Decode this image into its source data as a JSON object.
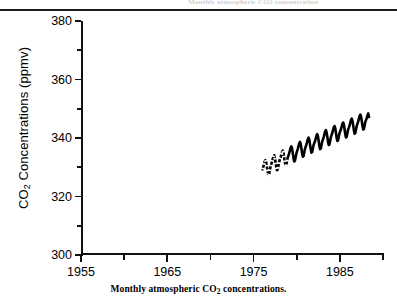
{
  "figure": {
    "top_ghost_text": "Monthly atmospheric CO2 concentrations",
    "caption_prefix": "Monthly atmospheric CO",
    "caption_sub": "2",
    "caption_suffix": " concentrations.",
    "ylabel_prefix": "CO",
    "ylabel_sub": "2",
    "ylabel_suffix": " Concentrations (ppmv)",
    "line_color": "#000000",
    "axis_color": "#111111",
    "background": "#ffffff"
  },
  "chart_data": {
    "type": "line",
    "title": "",
    "subtitle": "",
    "xlabel": "",
    "ylabel": "CO2 Concentrations (ppmv)",
    "caption": "Monthly atmospheric CO2 concentrations.",
    "grid": false,
    "legend": null,
    "xlim": [
      1955,
      1990
    ],
    "ylim": [
      300,
      380
    ],
    "xticks_major": [
      1955,
      1965,
      1975,
      1985
    ],
    "xticks_minor": [
      1960,
      1970,
      1980,
      1990
    ],
    "yticks_major": [
      300,
      320,
      340,
      360,
      380
    ],
    "yticks_minor": [
      310,
      330,
      350,
      370
    ],
    "xtick_labels": [
      "1955",
      "1965",
      "1975",
      "1985"
    ],
    "ytick_labels": [
      "300",
      "320",
      "340",
      "360",
      "380"
    ],
    "series": [
      {
        "name": "Monthly atmospheric CO2",
        "note": "Keeling-type record; monthly values with seasonal sawtooth. Early part of the drawn trace is broken/dashed.",
        "x": [
          1976.04,
          1976.13,
          1976.21,
          1976.29,
          1976.38,
          1976.46,
          1976.54,
          1976.63,
          1976.71,
          1976.79,
          1976.88,
          1976.96,
          1977.04,
          1977.13,
          1977.21,
          1977.29,
          1977.38,
          1977.46,
          1977.54,
          1977.63,
          1977.71,
          1977.79,
          1977.88,
          1977.96,
          1978.04,
          1978.13,
          1978.21,
          1978.29,
          1978.38,
          1978.46,
          1978.54,
          1978.63,
          1978.71,
          1978.79,
          1978.88,
          1978.96,
          1979.04,
          1979.13,
          1979.21,
          1979.29,
          1979.38,
          1979.46,
          1979.54,
          1979.63,
          1979.71,
          1979.79,
          1979.88,
          1979.96,
          1980.04,
          1980.13,
          1980.21,
          1980.29,
          1980.38,
          1980.46,
          1980.54,
          1980.63,
          1980.71,
          1980.79,
          1980.88,
          1980.96,
          1981.04,
          1981.13,
          1981.21,
          1981.29,
          1981.38,
          1981.46,
          1981.54,
          1981.63,
          1981.71,
          1981.79,
          1981.88,
          1981.96,
          1982.04,
          1982.13,
          1982.21,
          1982.29,
          1982.38,
          1982.46,
          1982.54,
          1982.63,
          1982.71,
          1982.79,
          1982.88,
          1982.96,
          1983.04,
          1983.13,
          1983.21,
          1983.29,
          1983.38,
          1983.46,
          1983.54,
          1983.63,
          1983.71,
          1983.79,
          1983.88,
          1983.96,
          1984.04,
          1984.13,
          1984.21,
          1984.29,
          1984.38,
          1984.46,
          1984.54,
          1984.63,
          1984.71,
          1984.79,
          1984.88,
          1984.96,
          1985.04,
          1985.13,
          1985.21,
          1985.29,
          1985.38,
          1985.46,
          1985.54,
          1985.63,
          1985.71,
          1985.79,
          1985.88,
          1985.96,
          1986.04,
          1986.13,
          1986.21,
          1986.29,
          1986.38,
          1986.46,
          1986.54,
          1986.63,
          1986.71,
          1986.79,
          1986.88,
          1986.96,
          1987.04,
          1987.13,
          1987.21,
          1987.29,
          1987.38,
          1987.46,
          1987.54,
          1987.63,
          1987.71,
          1987.79,
          1987.88,
          1987.96,
          1988.04,
          1988.13,
          1988.21,
          1988.29,
          1988.38
        ],
        "y": [
          329.3,
          330.2,
          331.0,
          332.0,
          332.4,
          331.8,
          330.3,
          328.6,
          327.4,
          327.6,
          328.9,
          330.1,
          331.0,
          331.8,
          332.7,
          333.6,
          334.1,
          333.4,
          331.9,
          330.1,
          329.0,
          329.2,
          330.5,
          331.7,
          332.6,
          333.3,
          334.3,
          335.2,
          335.7,
          335.0,
          333.5,
          331.7,
          330.6,
          330.8,
          332.1,
          333.3,
          334.0,
          334.8,
          335.7,
          336.6,
          337.1,
          336.4,
          334.9,
          333.1,
          332.0,
          332.2,
          333.5,
          334.7,
          335.5,
          336.3,
          337.3,
          338.2,
          338.7,
          338.0,
          336.5,
          334.7,
          333.6,
          333.8,
          335.1,
          336.3,
          337.0,
          337.8,
          338.7,
          339.6,
          340.1,
          339.4,
          337.9,
          336.1,
          335.0,
          335.2,
          336.5,
          337.7,
          338.3,
          339.0,
          339.9,
          340.8,
          341.3,
          340.6,
          339.1,
          337.3,
          336.2,
          336.4,
          337.7,
          338.9,
          339.5,
          340.3,
          341.3,
          342.2,
          342.7,
          342.0,
          340.5,
          338.7,
          337.6,
          337.8,
          339.1,
          340.3,
          341.0,
          341.8,
          342.7,
          343.6,
          344.1,
          343.4,
          341.9,
          340.1,
          339.0,
          339.2,
          340.5,
          341.7,
          342.3,
          343.0,
          343.9,
          344.8,
          345.3,
          344.6,
          343.1,
          341.3,
          340.2,
          340.4,
          341.7,
          342.9,
          343.5,
          344.3,
          345.2,
          346.1,
          346.6,
          345.9,
          344.4,
          342.6,
          341.5,
          341.7,
          343.0,
          344.2,
          344.9,
          345.7,
          346.6,
          347.5,
          348.0,
          347.3,
          345.8,
          344.0,
          342.9,
          343.1,
          344.4,
          345.6,
          346.2,
          346.9,
          347.8,
          348.4,
          347.2
        ]
      }
    ]
  }
}
